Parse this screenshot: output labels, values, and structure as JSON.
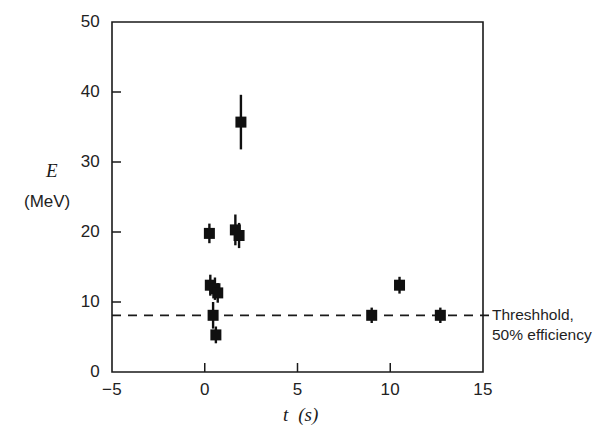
{
  "figure": {
    "background_color": "#ffffff",
    "ink_color": "#1a1a1a"
  },
  "axes": {
    "frame": {
      "left_px": 112,
      "top_px": 22,
      "right_px": 483,
      "bottom_px": 372
    },
    "y_title": "E",
    "y_units": "(MeV)",
    "x_title_t": "t",
    "x_title_units": "(s)"
  },
  "annotation": {
    "line1": "Threshhold,",
    "line2": "50% efficiency"
  },
  "chart_data": {
    "type": "scatter",
    "title": "",
    "xlabel": "t  (s)",
    "ylabel": "E (MeV)",
    "xlim": [
      -5,
      15
    ],
    "ylim": [
      0,
      50
    ],
    "xticks": [
      -5,
      0,
      5,
      10,
      15
    ],
    "yticks": [
      0,
      10,
      20,
      30,
      40,
      50
    ],
    "grid": false,
    "legend": null,
    "marker": "filled-square",
    "marker_color": "#101010",
    "errorbars": "vertical (symmetric)",
    "points": [
      {
        "x": 0.25,
        "y": 19.8,
        "yerr": 1.4
      },
      {
        "x": 1.65,
        "y": 20.3,
        "yerr": 2.2
      },
      {
        "x": 1.85,
        "y": 19.5,
        "yerr": 1.8
      },
      {
        "x": 1.95,
        "y": 35.7,
        "yerr": 3.9
      },
      {
        "x": 0.3,
        "y": 12.4,
        "yerr": 1.5
      },
      {
        "x": 0.55,
        "y": 11.9,
        "yerr": 1.6
      },
      {
        "x": 0.7,
        "y": 11.3,
        "yerr": 1.4
      },
      {
        "x": 0.45,
        "y": 8.1,
        "yerr": 1.9
      },
      {
        "x": 0.6,
        "y": 5.3,
        "yerr": 1.2
      },
      {
        "x": 9.0,
        "y": 8.1,
        "yerr": 1.1
      },
      {
        "x": 10.5,
        "y": 12.4,
        "yerr": 1.2
      },
      {
        "x": 12.7,
        "y": 8.1,
        "yerr": 1.1
      }
    ],
    "threshold_line": {
      "label": "Threshhold, 50% efficiency",
      "value": 8.1,
      "style": "dashed",
      "x_start": -5,
      "x_end": 15.6
    }
  }
}
